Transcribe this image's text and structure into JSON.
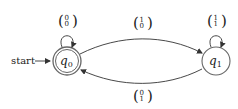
{
  "diagram": {
    "type": "finite-automaton",
    "start_label": "start",
    "states": [
      {
        "id": "q0",
        "name": "q",
        "sub": "0",
        "accepting": true,
        "start": true
      },
      {
        "id": "q1",
        "name": "q",
        "sub": "1",
        "accepting": false,
        "start": false
      }
    ],
    "transitions": [
      {
        "from": "q0",
        "to": "q0",
        "top": "0",
        "bottom": "0"
      },
      {
        "from": "q0",
        "to": "q1",
        "top": "1",
        "bottom": "0"
      },
      {
        "from": "q1",
        "to": "q1",
        "top": "1",
        "bottom": "1"
      },
      {
        "from": "q1",
        "to": "q0",
        "top": "0",
        "bottom": "1"
      }
    ],
    "colors": {
      "stroke": "#333333",
      "state_stroke": "#555555",
      "text": "#222222"
    }
  }
}
